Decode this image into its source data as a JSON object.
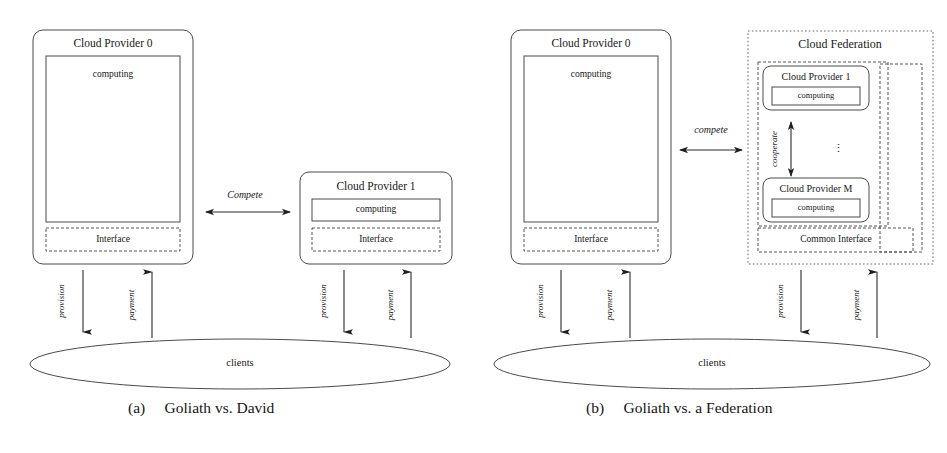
{
  "figure": {
    "background": "#ffffff",
    "ink": "#1a1a1a"
  },
  "panel_a": {
    "caption": "(a)     Goliath vs. David",
    "provider0": {
      "title": "Cloud Provider 0",
      "computing_label": "computing",
      "interface_label": "Interface"
    },
    "provider1": {
      "title": "Cloud Provider 1",
      "computing_label": "computing",
      "interface_label": "Interface"
    },
    "relation_label": "Compete",
    "clients_label": "clients",
    "flows": {
      "provider0_provision": "provision",
      "provider0_payment": "payment",
      "provider1_provision": "provision",
      "provider1_payment": "payment"
    }
  },
  "panel_b": {
    "caption": "(b)     Goliath vs. a Federation",
    "provider0": {
      "title": "Cloud Provider 0",
      "computing_label": "computing",
      "interface_label": "Interface"
    },
    "federation": {
      "title": "Cloud Federation",
      "provider_first": {
        "title": "Cloud Provider 1",
        "computing_label": "computing"
      },
      "provider_last": {
        "title": "Cloud Provider M",
        "computing_label": "computing"
      },
      "ellipsis": "⋮",
      "cooperate_label": "cooperate",
      "common_interface_label": "Common Interface"
    },
    "relation_label": "compete",
    "clients_label": "clients",
    "flows": {
      "provider0_provision": "provision",
      "provider0_payment": "payment",
      "federation_provision": "provision",
      "federation_payment": "payment"
    }
  }
}
